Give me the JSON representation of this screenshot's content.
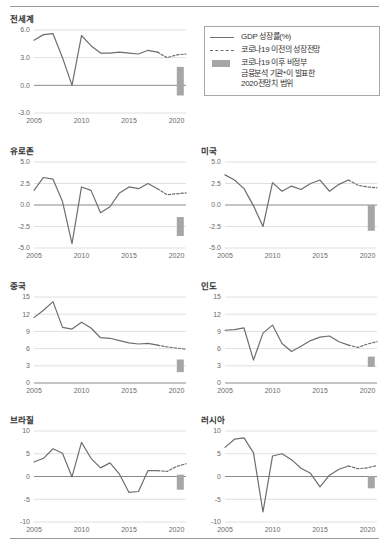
{
  "legend": {
    "items": [
      {
        "key": "solid-line",
        "lines": [
          "GDP 성장률(%)"
        ]
      },
      {
        "key": "dashed-line",
        "lines": [
          "코로나19 이전의 성장전망"
        ]
      },
      {
        "key": "grey-bar",
        "lines": [
          "코로나19 이후 비정부",
          "금융분석 기관*이 발표한",
          "2020전망치 범위"
        ]
      }
    ]
  },
  "chart_data": [
    {
      "type": "line",
      "title": "전세계",
      "xlabel": "",
      "ylabel": "",
      "xticks": [
        "2005",
        "2010",
        "2015",
        "2020"
      ],
      "yticks": [
        "6.0",
        "3.0",
        "0.0",
        "-3.0"
      ],
      "xlim": [
        2005,
        2021
      ],
      "ylim": [
        -3.0,
        6.0
      ],
      "grid": true,
      "legend_position": "top-right",
      "series": [
        {
          "name": "GDP 성장률(%)",
          "style": "solid",
          "x": [
            2005,
            2006,
            2007,
            2008,
            2009,
            2010,
            2011,
            2012,
            2013,
            2014,
            2015,
            2016,
            2017,
            2018
          ],
          "values": [
            4.9,
            5.5,
            5.6,
            3.0,
            0.0,
            5.4,
            4.3,
            3.5,
            3.5,
            3.6,
            3.5,
            3.4,
            3.8,
            3.6
          ]
        },
        {
          "name": "코로나19 이전의 성장전망",
          "style": "dashed",
          "x": [
            2018,
            2019,
            2020,
            2021
          ],
          "values": [
            3.6,
            3.0,
            3.3,
            3.4
          ]
        }
      ],
      "forecast_range": {
        "x": 2020.4,
        "low": -1.1,
        "high": 2.0
      }
    },
    {
      "type": "line",
      "title": "유로존",
      "xlabel": "",
      "ylabel": "",
      "xticks": [
        "2005",
        "2010",
        "2015",
        "2020"
      ],
      "yticks": [
        "5.0",
        "2.5",
        "0.0",
        "-2.5",
        "-5.0"
      ],
      "xlim": [
        2005,
        2021
      ],
      "ylim": [
        -5.0,
        5.0
      ],
      "grid": true,
      "series": [
        {
          "name": "GDP 성장률(%)",
          "style": "solid",
          "x": [
            2005,
            2006,
            2007,
            2008,
            2009,
            2010,
            2011,
            2012,
            2013,
            2014,
            2015,
            2016,
            2017,
            2018
          ],
          "values": [
            1.7,
            3.2,
            3.0,
            0.4,
            -4.5,
            2.1,
            1.7,
            -0.9,
            -0.2,
            1.4,
            2.1,
            1.9,
            2.5,
            1.9
          ]
        },
        {
          "name": "코로나19 이전의 성장전망",
          "style": "dashed",
          "x": [
            2018,
            2019,
            2020,
            2021
          ],
          "values": [
            1.9,
            1.2,
            1.3,
            1.4
          ]
        }
      ],
      "forecast_range": {
        "x": 2020.4,
        "low": -3.6,
        "high": -1.4
      }
    },
    {
      "type": "line",
      "title": "미국",
      "xlabel": "",
      "ylabel": "",
      "xticks": [
        "2005",
        "2010",
        "2015",
        "2020"
      ],
      "yticks": [
        "5.0",
        "2.5",
        "0.0",
        "-2.5",
        "-5.0"
      ],
      "xlim": [
        2005,
        2021
      ],
      "ylim": [
        -5.0,
        5.0
      ],
      "grid": true,
      "series": [
        {
          "name": "GDP 성장률(%)",
          "style": "solid",
          "x": [
            2005,
            2006,
            2007,
            2008,
            2009,
            2010,
            2011,
            2012,
            2013,
            2014,
            2015,
            2016,
            2017,
            2018
          ],
          "values": [
            3.5,
            2.9,
            1.9,
            -0.1,
            -2.5,
            2.6,
            1.6,
            2.2,
            1.8,
            2.5,
            2.9,
            1.6,
            2.4,
            2.9
          ]
        },
        {
          "name": "코로나19 이전의 성장전망",
          "style": "dashed",
          "x": [
            2018,
            2019,
            2020,
            2021
          ],
          "values": [
            2.9,
            2.3,
            2.1,
            2.0
          ]
        }
      ],
      "forecast_range": {
        "x": 2020.4,
        "low": -3.0,
        "high": 0.0
      }
    },
    {
      "type": "line",
      "title": "중국",
      "xlabel": "",
      "ylabel": "",
      "xticks": [
        "2005",
        "2010",
        "2015",
        "2020"
      ],
      "yticks": [
        "15",
        "12",
        "9",
        "6",
        "3",
        "0"
      ],
      "xlim": [
        2005,
        2021
      ],
      "ylim": [
        0,
        15
      ],
      "grid": true,
      "series": [
        {
          "name": "GDP 성장률(%)",
          "style": "solid",
          "x": [
            2005,
            2006,
            2007,
            2008,
            2009,
            2010,
            2011,
            2012,
            2013,
            2014,
            2015,
            2016,
            2017,
            2018
          ],
          "values": [
            11.4,
            12.7,
            14.2,
            9.7,
            9.4,
            10.6,
            9.6,
            7.9,
            7.8,
            7.4,
            7.0,
            6.8,
            6.9,
            6.6
          ]
        },
        {
          "name": "코로나19 이전의 성장전망",
          "style": "dashed",
          "x": [
            2018,
            2019,
            2020,
            2021
          ],
          "values": [
            6.6,
            6.3,
            6.1,
            5.9
          ]
        }
      ],
      "forecast_range": {
        "x": 2020.4,
        "low": 1.9,
        "high": 4.1
      }
    },
    {
      "type": "line",
      "title": "인도",
      "xlabel": "",
      "ylabel": "",
      "xticks": [
        "2005",
        "2010",
        "2015",
        "2020"
      ],
      "yticks": [
        "15",
        "12",
        "9",
        "6",
        "3",
        "0"
      ],
      "xlim": [
        2005,
        2021
      ],
      "ylim": [
        0,
        15
      ],
      "grid": true,
      "series": [
        {
          "name": "GDP 성장률(%)",
          "style": "solid",
          "x": [
            2005,
            2006,
            2007,
            2008,
            2009,
            2010,
            2011,
            2012,
            2013,
            2014,
            2015,
            2016,
            2017,
            2018
          ],
          "values": [
            9.2,
            9.3,
            9.6,
            4.0,
            8.7,
            10.1,
            6.9,
            5.5,
            6.4,
            7.4,
            8.0,
            8.2,
            7.2,
            6.6
          ]
        },
        {
          "name": "코로나19 이전의 성장전망",
          "style": "dashed",
          "x": [
            2018,
            2019,
            2020,
            2021
          ],
          "values": [
            6.6,
            6.2,
            6.8,
            7.2
          ]
        }
      ],
      "forecast_range": {
        "x": 2020.4,
        "low": 2.8,
        "high": 4.6
      }
    },
    {
      "type": "line",
      "title": "브라질",
      "xlabel": "",
      "ylabel": "",
      "xticks": [
        "2005",
        "2010",
        "2015",
        "2020"
      ],
      "yticks": [
        "10",
        "5",
        "0",
        "-5",
        "-10"
      ],
      "xlim": [
        2005,
        2021
      ],
      "ylim": [
        -10,
        10
      ],
      "grid": true,
      "series": [
        {
          "name": "GDP 성장률(%)",
          "style": "solid",
          "x": [
            2005,
            2006,
            2007,
            2008,
            2009,
            2010,
            2011,
            2012,
            2013,
            2014,
            2015,
            2016,
            2017,
            2018
          ],
          "values": [
            3.2,
            4.0,
            6.1,
            5.1,
            -0.1,
            7.5,
            4.0,
            1.9,
            3.0,
            0.5,
            -3.5,
            -3.3,
            1.3,
            1.3
          ]
        },
        {
          "name": "코로나19 이전의 성장전망",
          "style": "dashed",
          "x": [
            2018,
            2019,
            2020,
            2021
          ],
          "values": [
            1.3,
            1.1,
            2.2,
            2.8
          ]
        }
      ],
      "forecast_range": {
        "x": 2020.4,
        "low": -2.9,
        "high": 0.4
      }
    },
    {
      "type": "line",
      "title": "러시아",
      "xlabel": "",
      "ylabel": "",
      "xticks": [
        "2005",
        "2010",
        "2015",
        "2020"
      ],
      "yticks": [
        "10",
        "5",
        "0",
        "-5",
        "-10"
      ],
      "xlim": [
        2005,
        2021
      ],
      "ylim": [
        -10,
        10
      ],
      "grid": true,
      "series": [
        {
          "name": "GDP 성장률(%)",
          "style": "solid",
          "x": [
            2005,
            2006,
            2007,
            2008,
            2009,
            2010,
            2011,
            2012,
            2013,
            2014,
            2015,
            2016,
            2017,
            2018
          ],
          "values": [
            6.4,
            8.2,
            8.5,
            5.2,
            -7.8,
            4.5,
            5.0,
            3.7,
            1.8,
            0.7,
            -2.3,
            0.3,
            1.6,
            2.3
          ]
        },
        {
          "name": "코로나19 이전의 성장전망",
          "style": "dashed",
          "x": [
            2018,
            2019,
            2020,
            2021
          ],
          "values": [
            2.3,
            1.7,
            1.9,
            2.4
          ]
        }
      ],
      "forecast_range": {
        "x": 2020.4,
        "low": -2.6,
        "high": 0.1
      }
    }
  ],
  "colors": {
    "line": "#6e6e6e",
    "bar": "#a6a6a6",
    "grid": "#d8d8d8",
    "axis": "#8a8a8a",
    "text": "#333333",
    "tick": "#6b6b6b"
  }
}
